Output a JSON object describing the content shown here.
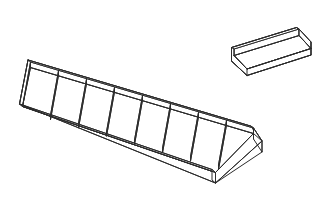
{
  "document": {
    "kind": "technical-line-drawing",
    "title": "Divided Tray and Plain Tray Isometric Assembly",
    "background_color": "#ffffff",
    "line_color": "#2b2b2b",
    "line_width": 1,
    "projection": "isometric",
    "caption": "",
    "alt_text": "Isometric outline drawing of a long shallow tray divided into eight compartments by seven cross dividers, with a separate smaller empty tray positioned to the upper right."
  },
  "objects": [
    {
      "id": "divided-tray",
      "name": "Large Divided Tray",
      "compartments": 8,
      "dividers": 7,
      "walls": [
        "back-wall",
        "front-wall",
        "left-end-wall",
        "right-end-wall"
      ],
      "open_top": true,
      "label": ""
    },
    {
      "id": "plain-tray",
      "name": "Small Plain Tray",
      "compartments": 1,
      "dividers": 0,
      "walls": [
        "back-wall",
        "front-wall",
        "left-end-wall",
        "right-end-wall"
      ],
      "open_top": true,
      "label": ""
    }
  ],
  "geometry": {
    "big_tray": {
      "base_back_left": [
        27,
        63
      ],
      "base_back_right": [
        260,
        132
      ],
      "base_front_right": [
        217,
        176
      ],
      "base_front_left": [
        22,
        70
      ],
      "wall_height": 13,
      "divider_count": 7
    },
    "small_tray": {
      "base_back_left": [
        227,
        47
      ],
      "base_back_right": [
        305,
        23
      ],
      "wall_height": 12
    }
  }
}
